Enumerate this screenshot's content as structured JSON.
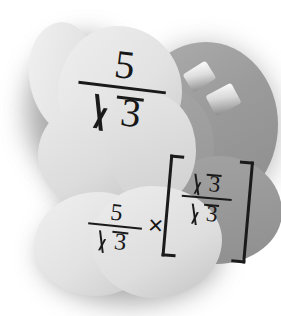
{
  "image": {
    "kind": "photographic-illustration",
    "subject": "grayscale cut-paper blob shapes with handwritten-style math",
    "background_color": "#ffffff",
    "shadow_color": "#8e8e8e"
  },
  "palette": {
    "light_blob": "#e4e4e4",
    "light_blob_highlight": "#f2f2f2",
    "light_blob_shade": "#c6c6c6",
    "dark_blob": "#9d9d9d",
    "dark_blob_shade": "#8d8d8d",
    "chip_white": "#fdfdfd",
    "ink": "#171717"
  },
  "shapes": {
    "upper_light_blob_label": "upper-left light blob",
    "lower_light_blob_label": "lower light blob",
    "right_dark_blob_label": "right dark blob",
    "chips": [
      {
        "name": "chip-1",
        "tilt_degrees": -4
      },
      {
        "name": "chip-2",
        "tilt_degrees": -32
      },
      {
        "name": "chip-3",
        "tilt_degrees": -28
      }
    ]
  },
  "math": {
    "top_fraction": {
      "numerator": "5",
      "denominator_radicand": "3",
      "denominator_symbol": "√",
      "plain_text": "5/√3"
    },
    "bottom_expression": {
      "left_fraction": {
        "numerator": "5",
        "denominator_radicand": "3",
        "plain_text": "5/√3"
      },
      "operator": "×",
      "bracket_open": "[",
      "bracket_close": "]",
      "bracketed_fraction": {
        "numerator_radicand": "3",
        "denominator_radicand": "3",
        "plain_text": "√3/√3"
      },
      "plain_text": "5/√3 × [√3/√3]"
    }
  }
}
